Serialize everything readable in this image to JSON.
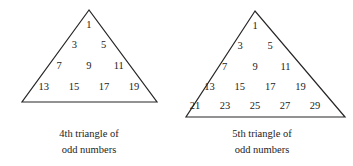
{
  "figure_kind": "geometric-number-diagram",
  "background_color": "#ffffff",
  "stroke_color": "#262626",
  "text_color": "#1c1c1c",
  "figures": [
    {
      "id": "fourth-triangle",
      "caption_line1": "4th triangle of",
      "caption_line2": "odd numbers",
      "apex": {
        "x": 89,
        "y": 10
      },
      "base_left": {
        "x": 22,
        "y": 102
      },
      "base_right": {
        "x": 157,
        "y": 102
      },
      "rows": [
        {
          "y": 26,
          "values": [
            "1"
          ]
        },
        {
          "y": 46,
          "values": [
            "3",
            "5"
          ]
        },
        {
          "y": 67,
          "values": [
            "7",
            "9",
            "11"
          ]
        },
        {
          "y": 88,
          "values": [
            "13",
            "15",
            "17",
            "19"
          ]
        }
      ],
      "caption_x": 89,
      "caption_y": 126
    },
    {
      "id": "fifth-triangle",
      "caption_line1": "5th triangle of",
      "caption_line2": "odd numbers",
      "apex": {
        "x": 255,
        "y": 11
      },
      "base_left": {
        "x": 186,
        "y": 117
      },
      "base_right": {
        "x": 345,
        "y": 117
      },
      "rows": [
        {
          "y": 27,
          "values": [
            "1"
          ]
        },
        {
          "y": 47,
          "values": [
            "3",
            "5"
          ]
        },
        {
          "y": 68,
          "values": [
            "7",
            "9",
            "11"
          ]
        },
        {
          "y": 88,
          "values": [
            "13",
            "15",
            "17",
            "19"
          ]
        },
        {
          "y": 107,
          "values": [
            "21",
            "23",
            "25",
            "27",
            "29"
          ]
        }
      ],
      "caption_x": 262,
      "caption_y": 126
    }
  ]
}
